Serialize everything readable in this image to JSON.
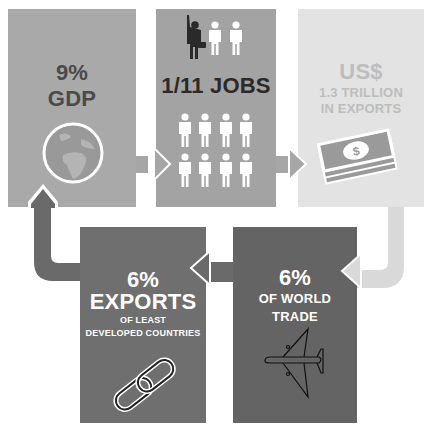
{
  "colors": {
    "box1": "#a9a9a9",
    "box2": "#a3a3a3",
    "box3": "#e3e3e3",
    "box4": "#6f6f6f",
    "box5": "#646464",
    "text_dark": "#4a4a4a",
    "text_black": "#2a2a2a",
    "text_light": "#bdbdbd",
    "text_white": "#ffffff",
    "arrow_mid": "#a6a6a6",
    "arrow_light": "#d9d9d9",
    "arrow_dark": "#6a6a6a"
  },
  "steps": [
    {
      "id": "gdp",
      "headline": "9%",
      "sub": "GDP",
      "icon": "globe-icon"
    },
    {
      "id": "jobs",
      "headline": "1/11 JOBS",
      "icon": "people-icon",
      "people_count": 11,
      "highlighted_person": "businessman-icon"
    },
    {
      "id": "exports",
      "headline": "US$",
      "line1": "1.3 TRILLION",
      "line2": "IN EXPORTS",
      "icon": "money-stack-icon",
      "money_symbol": "$"
    },
    {
      "id": "world-trade",
      "headline": "6%",
      "line1": "OF WORLD",
      "line2": "TRADE",
      "icon": "airplane-icon"
    },
    {
      "id": "ldc-exports",
      "headline": "6%",
      "line1": "EXPORTS",
      "line2": "OF LEAST",
      "line3": "DEVELOPED COUNTRIES",
      "icon": "chain-link-icon"
    }
  ]
}
